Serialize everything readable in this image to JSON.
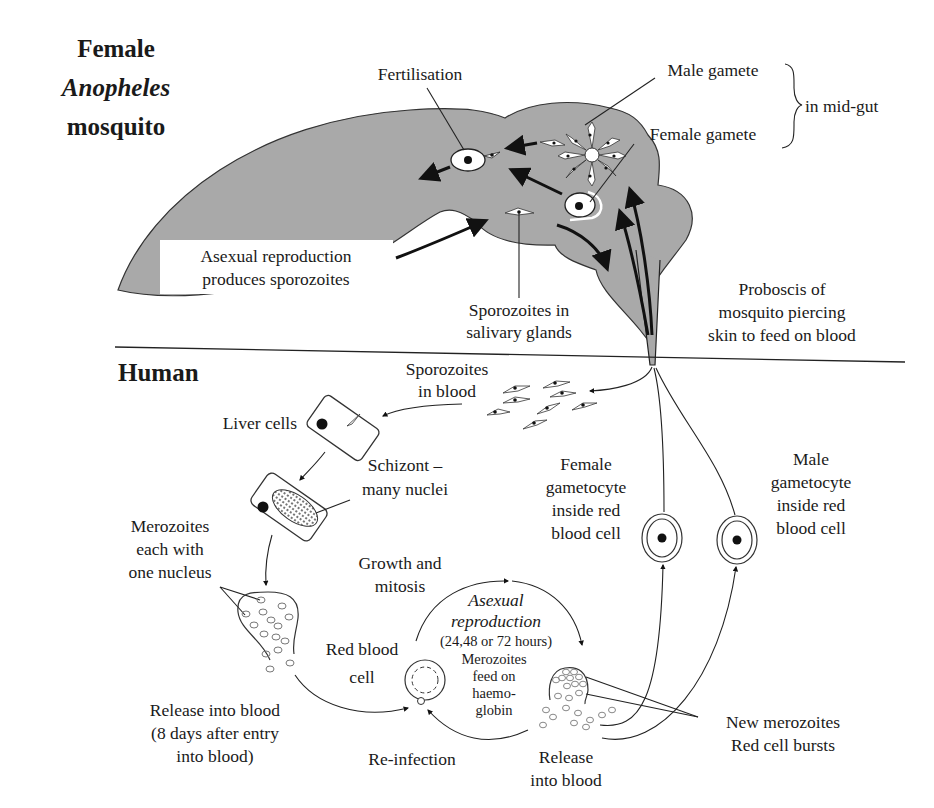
{
  "mosquito": {
    "title_line1": "Female",
    "title_line2": "Anopheles",
    "title_line3": "mosquito",
    "fertilisation": "Fertilisation",
    "male_gamete": "Male gamete",
    "female_gamete": "Female gamete",
    "in_mid_gut": "in mid-gut",
    "asexual_line1": "Asexual reproduction",
    "asexual_line2": "produces sporozoites",
    "sporozoites_salivary_line1": "Sporozoites in",
    "sporozoites_salivary_line2": "salivary glands",
    "proboscis_line1": "Proboscis of",
    "proboscis_line2": "mosquito piercing",
    "proboscis_line3": "skin to feed on blood",
    "body_color": "#a9a9a9"
  },
  "human": {
    "title": "Human",
    "sporozoites_blood_line1": "Sporozoites",
    "sporozoites_blood_line2": "in blood",
    "liver_cells": "Liver cells",
    "schizont_line1": "Schizont –",
    "schizont_line2": "many nuclei",
    "merozoites_line1": "Merozoites",
    "merozoites_line2": "each with",
    "merozoites_line3": "one nucleus",
    "release_line1": "Release into blood",
    "release_line2": "(8 days after entry",
    "release_line3": "into blood)",
    "growth_line1": "Growth and",
    "growth_line2": "mitosis",
    "asexual_repro_line1": "Asexual",
    "asexual_repro_line2": "reproduction",
    "hours": "(24,48 or 72 hours)",
    "red_blood_cell_line1": "Red blood",
    "red_blood_cell_line2": "cell",
    "feed_line1": "Merozoites",
    "feed_line2": "feed on",
    "feed_line3": "haemo-",
    "feed_line4": "globin",
    "reinfection": "Re-infection",
    "release2_line1": "Release",
    "release2_line2": "into blood",
    "new_merozoites": "New merozoites",
    "red_cell_bursts": "Red cell bursts",
    "female_gametocyte_line1": "Female",
    "female_gametocyte_line2": "gametocyte",
    "female_gametocyte_line3": "inside red",
    "female_gametocyte_line4": "blood cell",
    "male_gametocyte_line1": "Male",
    "male_gametocyte_line2": "gametocyte",
    "male_gametocyte_line3": "inside red",
    "male_gametocyte_line4": "blood cell"
  }
}
